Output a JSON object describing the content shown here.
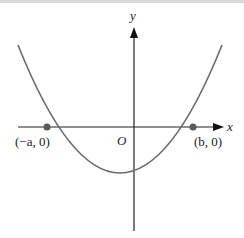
{
  "diagram": {
    "type": "parabola-graph",
    "axes": {
      "x_label": "x",
      "y_label": "y",
      "origin_label": "O"
    },
    "points": [
      {
        "label": "(−a, 0)",
        "name": "left-root"
      },
      {
        "label": "(b, 0)",
        "name": "right-root"
      }
    ],
    "colors": {
      "curve": "#6b6b6b",
      "axes": "#222222",
      "point": "#5a5a5a"
    }
  }
}
